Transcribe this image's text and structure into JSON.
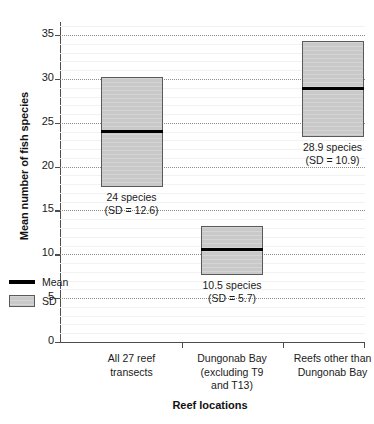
{
  "chart_data": {
    "type": "bar",
    "title": "",
    "subtitle": "",
    "xlabel": "Reef locations",
    "ylabel": "Mean number of fish species",
    "ylim": [
      0,
      36.5
    ],
    "yticks": [
      0,
      5,
      10,
      15,
      20,
      25,
      30,
      35
    ],
    "ytick_labels": [
      "0",
      "5",
      "10",
      "15",
      "20",
      "25",
      "30",
      "35"
    ],
    "grid": "horizontal-dotted-major-plus-faint-minor",
    "legend_position": "inside-lower-left",
    "categories": [
      "All 27 reef transects",
      "Dungonab Bay (excluding T9 and T13)",
      "Reefs other than Dungonab Bay"
    ],
    "series": [
      {
        "name": "Mean",
        "values": [
          24.0,
          10.5,
          28.9
        ]
      },
      {
        "name": "SD",
        "values": [
          12.6,
          5.7,
          10.9
        ]
      }
    ],
    "bars": [
      {
        "category": "All 27 reef transects",
        "mean": 24.0,
        "sd": 12.6,
        "box_top": 30.2,
        "box_bottom": 17.7,
        "label_line1": "24 species",
        "label_line2": "(SD = 12.6)"
      },
      {
        "category": "Dungonab Bay (excluding T9 and T13)",
        "mean": 10.5,
        "sd": 5.7,
        "box_top": 13.2,
        "box_bottom": 7.6,
        "label_line1": "10.5 species",
        "label_line2": "(SD = 5.7)"
      },
      {
        "category": "Reefs other than Dungonab Bay",
        "mean": 28.9,
        "sd": 10.9,
        "box_top": 34.3,
        "box_bottom": 23.4,
        "label_line1": "28.9 species",
        "label_line2": "(SD = 10.9)"
      }
    ],
    "legend": [
      {
        "label": "Mean",
        "marker": "black-line",
        "color": "#000000"
      },
      {
        "label": "SD",
        "marker": "gray-box",
        "color": "#c9c9c9"
      }
    ],
    "colors": {
      "bar_fill": "#c9c9c9",
      "bar_edge": "#5a5a5a",
      "mean_line": "#000000",
      "axis": "#4d4d4d",
      "gridline_major": "#8c8c8c",
      "gridline_minor": "#f2f2f2",
      "background": "#ffffff",
      "text": "#1a1a1a"
    }
  },
  "category_labels": [
    {
      "lines": [
        "All 27 reef",
        "transects"
      ]
    },
    {
      "lines": [
        "Dungonab Bay",
        "(excluding T9",
        "and T13)"
      ]
    },
    {
      "lines": [
        "Reefs other than",
        "Dungonab Bay"
      ]
    }
  ]
}
